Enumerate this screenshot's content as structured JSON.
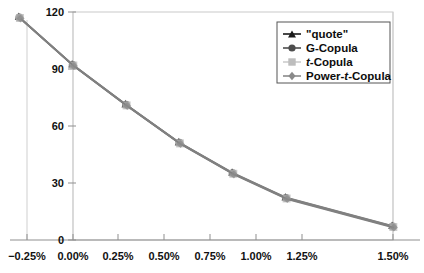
{
  "chart_data": {
    "type": "line",
    "title": "",
    "xlabel": "",
    "ylabel": "",
    "x": [
      -0.25,
      0.0,
      0.25,
      0.5,
      0.75,
      1.0,
      1.5
    ],
    "xtick_labels": [
      "−0.25%",
      "0.00%",
      "0.25%",
      "0.50%",
      "0.75%",
      "1.00%",
      "1.25%",
      "1.50%"
    ],
    "xtick_values": [
      -0.25,
      0.0,
      0.25,
      0.5,
      0.75,
      1.0,
      1.25,
      1.5
    ],
    "ytick_labels": [
      "0",
      "30",
      "60",
      "90",
      "120"
    ],
    "ytick_values": [
      0,
      30,
      60,
      90,
      120
    ],
    "xlim": [
      -0.25,
      1.5
    ],
    "ylim": [
      0,
      120
    ],
    "grid": "vertical-at-minus-0.25-and-0.00-and-1.50",
    "legend_position": "upper-right",
    "series": [
      {
        "name": "\"quote\"",
        "marker": "triangle",
        "color": "#1a1a1a",
        "values": [
          117,
          92,
          71,
          51,
          35,
          22,
          7
        ]
      },
      {
        "name": "G-Copula",
        "marker": "circle",
        "color": "#4d4d4d",
        "values": [
          117,
          92,
          71,
          51,
          35,
          22,
          7
        ]
      },
      {
        "name": "t-Copula",
        "marker": "square",
        "color": "#bdbdbd",
        "values": [
          117,
          92,
          71,
          51,
          35,
          22,
          7
        ]
      },
      {
        "name": "Power-t-Copula",
        "marker": "diamond",
        "color": "#8a8a8a",
        "values": [
          117,
          92,
          71,
          51,
          35,
          22,
          7
        ]
      }
    ]
  },
  "legend": {
    "items": [
      {
        "label_pre": "\"quote\"",
        "label_ital": "",
        "label_post": ""
      },
      {
        "label_pre": "G-Copula",
        "label_ital": "",
        "label_post": ""
      },
      {
        "label_pre": "",
        "label_ital": "t",
        "label_post": "-Copula"
      },
      {
        "label_pre": "Power-",
        "label_ital": "t",
        "label_post": "-Copula"
      }
    ]
  },
  "colors": {
    "line": "#808080",
    "frame": "#c9c9c9",
    "axis": "#8f8f8f",
    "text": "#111111"
  }
}
